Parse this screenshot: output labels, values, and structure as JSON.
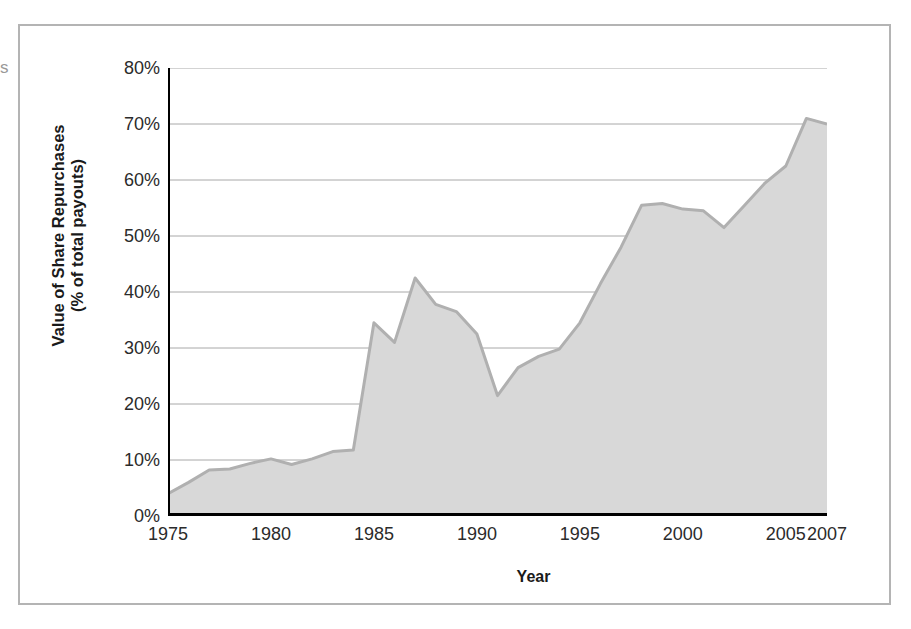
{
  "page": {
    "bleed_glyph": "s"
  },
  "chart_data": {
    "type": "area",
    "title": "",
    "xlabel": "Year",
    "ylabel": "Value of Share Repurchases\n(% of total payouts)",
    "ylabel_line1": "Value of Share Repurchases",
    "ylabel_line2": "(% of total payouts)",
    "xlim": [
      1975,
      2007
    ],
    "ylim": [
      0,
      80
    ],
    "grid": true,
    "grid_orientation": "horizontal",
    "legend": "none",
    "series_name": "Value of Share Repurchases (% of total payouts)",
    "fill_color": "#d8d8d8",
    "line_color": "#b0b0b0",
    "axis_color": "#000000",
    "gridline_color": "#a8a8a8",
    "y_ticks": [
      0,
      10,
      20,
      30,
      40,
      50,
      60,
      70,
      80
    ],
    "y_tick_labels": [
      "0%",
      "10%",
      "20%",
      "30%",
      "40%",
      "50%",
      "60%",
      "70%",
      "80%"
    ],
    "x_ticks": [
      1975,
      1980,
      1985,
      1990,
      1995,
      2000,
      2005,
      2007
    ],
    "x_tick_labels": [
      "1975",
      "1980",
      "1985",
      "1990",
      "1995",
      "2000",
      "2005",
      "2007"
    ],
    "x": [
      1975,
      1976,
      1977,
      1978,
      1979,
      1980,
      1981,
      1982,
      1983,
      1984,
      1985,
      1986,
      1987,
      1988,
      1989,
      1990,
      1991,
      1992,
      1993,
      1994,
      1995,
      1996,
      1997,
      1998,
      1999,
      2000,
      2001,
      2002,
      2003,
      2004,
      2005,
      2006,
      2007
    ],
    "values": [
      4.0,
      6.0,
      8.2,
      8.4,
      9.4,
      10.2,
      9.2,
      10.2,
      11.5,
      11.8,
      34.5,
      31.0,
      42.5,
      37.8,
      36.5,
      32.5,
      21.5,
      26.5,
      28.5,
      29.8,
      34.5,
      41.5,
      48.0,
      55.5,
      55.8,
      54.8,
      54.5,
      51.5,
      55.5,
      59.5,
      62.5,
      71.0,
      70.0
    ],
    "units": "%"
  }
}
